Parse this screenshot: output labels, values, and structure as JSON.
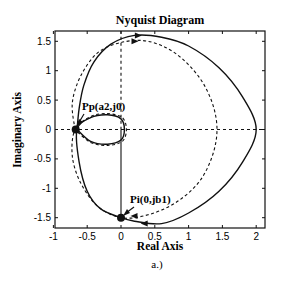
{
  "chart_data": {
    "type": "line",
    "title": "Nyquist Diagram",
    "xlabel": "Real Axis",
    "ylabel": "Imaginary Axis",
    "caption": "a.)",
    "xlim": [
      -1,
      2.1
    ],
    "ylim": [
      -1.68,
      1.68
    ],
    "xticks": [
      -1,
      -0.5,
      0,
      0.5,
      1,
      1.5,
      2
    ],
    "xtick_labels": [
      "-1",
      "-0.5",
      "0",
      "0.5",
      "1",
      "1.5",
      "2"
    ],
    "yticks": [
      -1.5,
      -1,
      -0.5,
      0,
      0.5,
      1,
      1.5
    ],
    "ytick_labels": [
      "-1.5",
      "-1",
      "-0.5",
      "0",
      "0.5",
      "1",
      "1.5"
    ],
    "grid": false,
    "reference_lines": [
      {
        "orientation": "horizontal",
        "value": 0,
        "style": "dashed"
      },
      {
        "orientation": "vertical",
        "value": 0,
        "style": "dashed",
        "range": [
          0,
          1.68
        ]
      },
      {
        "orientation": "vertical",
        "value": 0,
        "style": "solid",
        "range": [
          -1.5,
          0
        ]
      }
    ],
    "series": [
      {
        "name": "solid",
        "style": "solid",
        "points": [
          [
            -0.65,
            0
          ],
          [
            -0.62,
            0.35
          ],
          [
            -0.55,
            0.75
          ],
          [
            -0.4,
            1.15
          ],
          [
            -0.15,
            1.45
          ],
          [
            0.2,
            1.6
          ],
          [
            0.6,
            1.57
          ],
          [
            1.0,
            1.42
          ],
          [
            1.45,
            1.05
          ],
          [
            1.8,
            0.55
          ],
          [
            2.0,
            0
          ],
          [
            1.8,
            -0.55
          ],
          [
            1.45,
            -1.05
          ],
          [
            1.0,
            -1.42
          ],
          [
            0.6,
            -1.6
          ],
          [
            0.2,
            -1.56
          ],
          [
            0,
            -1.5
          ],
          [
            -0.3,
            -1.35
          ],
          [
            -0.5,
            -1.05
          ],
          [
            -0.62,
            -0.55
          ],
          [
            -0.65,
            0
          ],
          [
            -0.45,
            0.2
          ],
          [
            -0.2,
            0.25
          ],
          [
            0,
            0.18
          ],
          [
            0.05,
            0
          ],
          [
            0,
            -0.18
          ],
          [
            -0.2,
            -0.25
          ],
          [
            -0.45,
            -0.2
          ],
          [
            -0.65,
            0
          ]
        ]
      },
      {
        "name": "dashed",
        "style": "dashed",
        "points": [
          [
            -0.68,
            0
          ],
          [
            -0.72,
            0.45
          ],
          [
            -0.6,
            0.9
          ],
          [
            -0.35,
            1.3
          ],
          [
            0,
            1.48
          ],
          [
            0.4,
            1.5
          ],
          [
            0.8,
            1.3
          ],
          [
            1.15,
            0.9
          ],
          [
            1.35,
            0.45
          ],
          [
            1.42,
            0
          ],
          [
            1.35,
            -0.45
          ],
          [
            1.15,
            -0.9
          ],
          [
            0.8,
            -1.25
          ],
          [
            0.4,
            -1.45
          ],
          [
            0,
            -1.5
          ],
          [
            -0.35,
            -1.3
          ],
          [
            -0.6,
            -0.9
          ],
          [
            -0.72,
            -0.45
          ],
          [
            -0.68,
            0
          ],
          [
            -0.45,
            0.22
          ],
          [
            -0.2,
            0.27
          ],
          [
            0.02,
            0.2
          ],
          [
            0.08,
            0
          ],
          [
            0.02,
            -0.2
          ],
          [
            -0.2,
            -0.27
          ],
          [
            -0.45,
            -0.22
          ],
          [
            -0.68,
            0
          ]
        ]
      }
    ],
    "annotations": [
      {
        "text": "Pp(a2,j0)",
        "x": -0.67,
        "y": 0
      },
      {
        "text": "Pi(0,jb1)",
        "x": 0,
        "y": -1.5
      }
    ]
  }
}
